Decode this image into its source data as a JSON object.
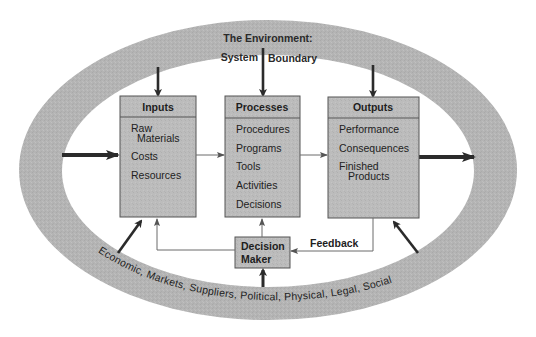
{
  "diagram": {
    "environment": {
      "title_line1": "The Environment:",
      "title_line2_left": "System",
      "title_line2_right": "Boundary",
      "factors_text": "Economic,  Markets,  Suppliers,  Political,  Physical,  Legal,  Social",
      "factors": [
        "Economic",
        "Markets",
        "Suppliers",
        "Political",
        "Physical",
        "Legal",
        "Social"
      ]
    },
    "boxes": {
      "inputs": {
        "header": "Inputs",
        "items": [
          "Raw",
          "Materials",
          "Costs",
          "Resources"
        ]
      },
      "processes": {
        "header": "Processes",
        "items": [
          "Procedures",
          "Programs",
          "Tools",
          "Activities",
          "Decisions"
        ]
      },
      "outputs": {
        "header": "Outputs",
        "items": [
          "Performance",
          "Consequences",
          "Finished",
          "Products"
        ]
      },
      "decision_maker": {
        "line1": "Decision",
        "line2": "Maker"
      }
    },
    "labels": {
      "feedback": "Feedback"
    },
    "colors": {
      "band": "#b3b3b3",
      "box_fill": "#bdbdbd",
      "box_stroke": "#555555",
      "arrow": "#2b2b2b",
      "thin_line": "#6a6a6a"
    }
  }
}
